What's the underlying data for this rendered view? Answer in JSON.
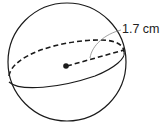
{
  "diagram": {
    "shape": "sphere",
    "radius_label": "1.7 cm",
    "colors": {
      "stroke": "#1a1a1a",
      "background": "#ffffff",
      "leader": "#888888"
    }
  }
}
